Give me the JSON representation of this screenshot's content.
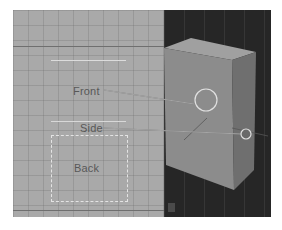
{
  "left_panel": {
    "view": "unwrapped-texture-layout",
    "labels": {
      "front": "Front",
      "side": "Side",
      "back": "Back"
    },
    "background_color": "#a9a9a9"
  },
  "right_panel": {
    "view": "3d-viewport",
    "object": "box",
    "background_color": "#262626",
    "object_color": "#8c8c8c",
    "stats_lines": [
      "",
      "",
      "",
      "",
      ""
    ]
  },
  "callouts": [
    {
      "label_ref": "front",
      "target": "front-face-circle"
    },
    {
      "label_ref": "side",
      "target": "side-face-circle"
    }
  ]
}
